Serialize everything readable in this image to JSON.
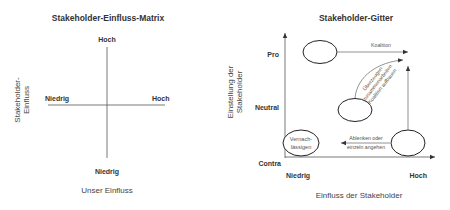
{
  "matrix": {
    "title": "Stakeholder-Einfluss-Matrix",
    "y_axis_label_line1": "Stakeholder-",
    "y_axis_label_line2": "Einfluss",
    "x_axis_label": "Unser Einfluss",
    "top_label": "Hoch",
    "bottom_label": "Niedrig",
    "left_label": "Niedrig",
    "right_label": "Hoch"
  },
  "grid": {
    "title": "Stakeholder-Gitter",
    "y_axis_label_line1": "Einstellung der",
    "y_axis_label_line2": "Stakeholder",
    "x_axis_label": "Einfluss der Stakeholder",
    "y_ticks": [
      "Pro",
      "Neutral",
      "Contra"
    ],
    "x_ticks": [
      "Niedrig",
      "Hoch"
    ],
    "nodes": {
      "pro_high": "",
      "neutral": "",
      "contra_high": "",
      "contra_low_line1": "Vernach-",
      "contra_low_line2": "lässigen"
    },
    "arrows": {
      "coalition": "Koalition",
      "persuade_line1": "Überzeugen",
      "persuade_line2": "zusammenarbeiten",
      "persuade_line3": "Koalition aufbauen",
      "distract_line1": "Ablenken oder",
      "distract_line2": "einzeln angehen"
    }
  }
}
